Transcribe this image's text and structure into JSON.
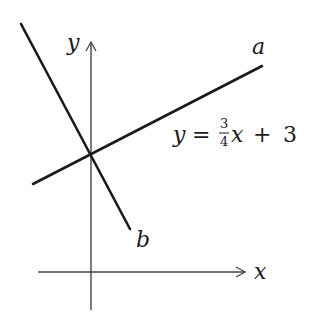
{
  "diagram": {
    "axes": {
      "x_label": "x",
      "y_label": "y",
      "origin": [
        91,
        272
      ],
      "x_axis": {
        "from": [
          38,
          272
        ],
        "to": [
          245,
          272
        ]
      },
      "y_axis": {
        "from": [
          91,
          310
        ],
        "to": [
          91,
          42
        ]
      }
    },
    "lines": [
      {
        "name": "a",
        "label": "a",
        "from": [
          33,
          184
        ],
        "to": [
          262,
          66
        ],
        "equation": "y = 3/4 x + 3"
      },
      {
        "name": "b",
        "label": "b",
        "from": [
          21,
          24
        ],
        "to": [
          130,
          229
        ]
      }
    ],
    "intersection": [
      91,
      154
    ],
    "equation": {
      "lhs": "y",
      "equals": "=",
      "frac_num": "3",
      "frac_den": "4",
      "var": "x",
      "plus": "+",
      "const": "3"
    },
    "colors": {
      "stroke": "#1a1a1a",
      "axis": "#444444",
      "background": "#ffffff"
    }
  }
}
